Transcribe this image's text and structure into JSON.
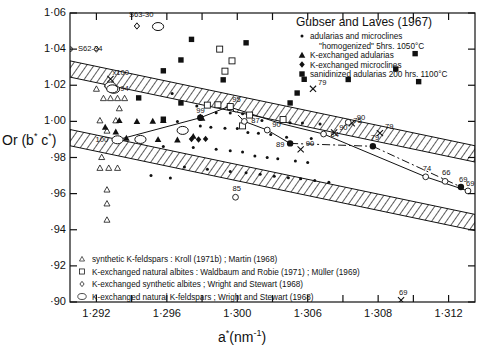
{
  "figure": {
    "xlabel_main": "a",
    "xlabel_sup": "*",
    "xlabel_unit": "(nm",
    "xlabel_unit_sup": "-1",
    "xlabel_unit_end": ")",
    "ylabel": "Or (b* c*)"
  },
  "chart_data": {
    "type": "scatter",
    "title": "",
    "xlabel": "a* (nm^-1)",
    "ylabel": "Or (b* c*)",
    "xlim": [
      1.2905,
      1.3135
    ],
    "ylim": [
      0.9,
      1.06
    ],
    "grid": false,
    "xticks": [
      "1·292",
      "1·296",
      "1·300",
      "1·306",
      "1·308",
      "1·312"
    ],
    "xtick_values": [
      1.292,
      1.296,
      1.3,
      1.304,
      1.308,
      1.312
    ],
    "yticks": [
      "1·06",
      "1·04",
      "1·02",
      "1·00",
      "·98",
      "·96",
      "·94",
      "·92",
      "·90"
    ],
    "ytick_values": [
      1.06,
      1.04,
      1.02,
      1.0,
      0.98,
      0.96,
      0.94,
      0.92,
      0.9
    ],
    "legend_position": "top-right and bottom-left inside axes",
    "bands": [
      {
        "name": "upper-hatched-band",
        "x1": 1.2905,
        "y1_top": 1.0335,
        "y1_bot": 1.0245,
        "x2": 1.3135,
        "y2_top": 0.9865,
        "y2_bot": 0.9775
      },
      {
        "name": "lower-hatched-band",
        "x1": 1.2905,
        "y1_top": 0.9955,
        "y1_bot": 0.9865,
        "x2": 1.3135,
        "y2_top": 0.9485,
        "y2_bot": 0.9395
      }
    ],
    "series": [
      {
        "name": "adularias and microclines \"homogenized\" 5hrs. 1050°C",
        "marker": "small-filled-circle",
        "points": [
          [
            1.2963,
            1.0155
          ],
          [
            1.2977,
            1.0085
          ],
          [
            1.2988,
            1.0048
          ],
          [
            1.2996,
            1.0046
          ],
          [
            1.3003,
            1.0042
          ],
          [
            1.3014,
            1.0005
          ],
          [
            1.3025,
            0.9998
          ],
          [
            1.303,
            0.9993
          ],
          [
            1.3037,
            0.9991
          ],
          [
            1.3047,
            0.9986
          ],
          [
            1.2966,
            0.9999
          ],
          [
            1.2979,
            0.9975
          ],
          [
            1.2985,
            0.9968
          ],
          [
            1.2993,
            0.9962
          ],
          [
            1.3,
            0.996
          ],
          [
            1.3006,
            0.9938
          ],
          [
            1.3012,
            0.9934
          ],
          [
            1.3019,
            0.9927
          ],
          [
            1.3028,
            0.9912
          ],
          [
            1.3042,
            0.9905
          ],
          [
            1.2958,
            0.9861
          ],
          [
            1.2975,
            0.9855
          ],
          [
            1.2988,
            0.9846
          ],
          [
            1.2996,
            0.9837
          ],
          [
            1.3003,
            0.983
          ],
          [
            1.301,
            0.9808
          ],
          [
            1.3017,
            0.98
          ],
          [
            1.3023,
            0.9793
          ],
          [
            1.3033,
            0.978
          ],
          [
            1.304,
            0.9772
          ],
          [
            1.297,
            0.9747
          ],
          [
            1.2983,
            0.9735
          ],
          [
            1.2996,
            0.9722
          ],
          [
            1.3005,
            0.9715
          ],
          [
            1.3013,
            0.9707
          ],
          [
            1.3021,
            0.9696
          ],
          [
            1.3029,
            0.9688
          ],
          [
            1.3036,
            0.9682
          ],
          [
            1.3044,
            0.9673
          ],
          [
            1.3052,
            0.9663
          ],
          [
            1.2951,
            0.97
          ],
          [
            1.2962,
            0.9686
          ]
        ]
      },
      {
        "name": "K-exchanged adularias",
        "marker": "filled-triangle",
        "points": [
          [
            1.2933,
            1.0005
          ],
          [
            1.2943,
            1.0
          ],
          [
            1.2952,
            1.0002
          ],
          [
            1.2958,
            1.0006
          ],
          [
            1.2925,
            0.9968
          ],
          [
            1.2931,
            0.9942
          ],
          [
            1.2937,
            0.9908
          ],
          [
            1.2944,
            0.9903
          ],
          [
            1.2955,
            0.99
          ],
          [
            1.2966,
            0.9898
          ],
          [
            1.2975,
            0.9918
          ],
          [
            1.298,
            1.0018
          ]
        ]
      },
      {
        "name": "K-exchanged microclines",
        "marker": "filled-diamond-cluster",
        "points": [
          [
            1.2974,
            0.9902
          ],
          [
            1.2978,
            0.99
          ],
          [
            1.2982,
            0.9903
          ],
          [
            1.2979,
            1.0024
          ]
        ]
      },
      {
        "name": "sanidinized adularias 200 hrs. 1100°C",
        "marker": "filled-square",
        "points": [
          [
            1.2958,
            1.028
          ],
          [
            1.2974,
            1.0454
          ],
          [
            1.2968,
            1.034
          ],
          [
            1.3005,
            1.0435
          ],
          [
            1.3038,
            1.0233
          ],
          [
            1.3063,
            1.0232
          ],
          [
            1.2992,
            1.023
          ],
          [
            1.2944,
            1.013
          ],
          [
            1.2968,
            1.0102
          ],
          [
            1.2958,
            1.0012
          ],
          [
            1.309,
            1.029
          ],
          [
            1.3103,
            1.022
          ],
          [
            1.3101,
            1.0375
          ],
          [
            1.3034,
            1.0157
          ],
          [
            1.303,
            1.0102
          ]
        ]
      },
      {
        "name": "synthetic K-feldspars: Kroll (1971b); Martin (1968)",
        "marker": "open-triangle-small",
        "points": [
          [
            1.292,
            1.018
          ],
          [
            1.2928,
            1.018
          ],
          [
            1.2924,
            1.0128
          ],
          [
            1.2928,
            1.0128
          ],
          [
            1.2932,
            1.0128
          ],
          [
            1.2936,
            1.0128
          ],
          [
            1.2933,
            1.0072
          ],
          [
            1.2922,
            1.0005
          ],
          [
            1.2931,
            1.0005
          ],
          [
            1.2926,
            0.9948
          ],
          [
            1.2923,
            0.9802
          ],
          [
            1.2922,
            0.9742
          ],
          [
            1.2927,
            0.9742
          ],
          [
            1.2932,
            0.9742
          ],
          [
            1.2926,
            0.9622
          ],
          [
            1.2926,
            0.9545
          ],
          [
            1.2926,
            0.9455
          ]
        ]
      },
      {
        "name": "K-exchanged natural albites: Waldbaum and Robie (1971); Müller (1969)",
        "marker": "open-square",
        "points": [
          [
            1.299,
            1.04
          ],
          [
            1.2997,
            1.0335
          ],
          [
            1.2993,
            1.0278
          ],
          [
            1.2983,
            1.009
          ],
          [
            1.2989,
            1.0092
          ],
          [
            1.3007,
            1.0035
          ],
          [
            1.3003,
            0.9975
          ],
          [
            1.3026,
            1.001
          ]
        ]
      },
      {
        "name": "K-exchanged synthetic albites: Wright and Stewart (1968)",
        "marker": "open-diamond-small",
        "points": [
          [
            1.2943,
            1.0528
          ],
          [
            1.292,
            1.04
          ],
          [
            1.2926,
            1.0195
          ],
          [
            1.2931,
            1.018
          ]
        ]
      },
      {
        "name": "K-exchanged natural K-feldspars: Wright and Stewart (1968)",
        "marker": "open-circle-large",
        "points": [
          [
            1.2955,
            1.0525
          ],
          [
            1.2928,
            1.0196
          ],
          [
            1.293,
            1.0178
          ],
          [
            1.2969,
            0.995
          ],
          [
            1.2945,
            0.99
          ]
        ]
      }
    ],
    "curves": [
      {
        "name": "curve-100-99-95",
        "style": "solid",
        "points": [
          [
            1.2932,
            0.9898
          ],
          [
            1.2979,
            1.002
          ],
          [
            1.2995,
            1.0082
          ]
        ]
      },
      {
        "name": "curve-95-90-84",
        "style": "solid",
        "points": [
          [
            1.2995,
            1.0082
          ],
          [
            1.3024,
            0.999
          ],
          [
            1.3049,
            0.993
          ]
        ]
      },
      {
        "name": "curve-84-74",
        "style": "solid",
        "points": [
          [
            1.3049,
            0.993
          ],
          [
            1.3107,
            0.9693
          ]
        ]
      },
      {
        "name": "curve-74-69open",
        "style": "solid",
        "points": [
          [
            1.3107,
            0.9693
          ],
          [
            1.3131,
            0.9615
          ]
        ]
      },
      {
        "name": "curve-87-90-89-dashed",
        "style": "solid",
        "points": [
          [
            1.3004,
            1.0
          ],
          [
            1.3017,
            0.9952
          ],
          [
            1.303,
            0.9878
          ]
        ]
      },
      {
        "name": "curve-95-87-longdash",
        "style": "dashed",
        "points": [
          [
            1.2996,
            1.0078
          ],
          [
            1.3004,
            1.0
          ]
        ]
      },
      {
        "name": "curve-89-79-dashdot",
        "style": "dashdot",
        "points": [
          [
            1.303,
            0.9878
          ],
          [
            1.3077,
            0.9862
          ]
        ]
      },
      {
        "name": "curve-79-69filled-dashdot",
        "style": "dashdot",
        "points": [
          [
            1.3077,
            0.9862
          ],
          [
            1.3127,
            0.9637
          ]
        ]
      }
    ],
    "labeled_points": [
      {
        "label": "S63-30",
        "x": 1.2943,
        "y": 1.0528,
        "marker": "open-diamond-small"
      },
      {
        "label": "S62-34",
        "x": 1.2905,
        "y": 1.04,
        "marker": "open-circle-tiny"
      },
      {
        "label": "x100",
        "x": 1.2928,
        "y": 1.0235,
        "marker": "cross"
      },
      {
        "label": "94",
        "x": 1.2929,
        "y": 1.018,
        "marker": "open-circle-large"
      },
      {
        "label": "95",
        "x": 1.2996,
        "y": 1.0082,
        "marker": "open-square"
      },
      {
        "label": "99",
        "x": 1.2979,
        "y": 1.002,
        "marker": "filled-circle-large"
      },
      {
        "label": "100",
        "x": 1.2932,
        "y": 0.9898,
        "marker": "open-circle-large"
      },
      {
        "label": "87",
        "x": 1.3004,
        "y": 1.0,
        "marker": "open-circle"
      },
      {
        "label": "90",
        "x": 1.3017,
        "y": 0.9952,
        "marker": "open-circle"
      },
      {
        "label": "90",
        "x": 1.3055,
        "y": 0.9938,
        "marker": "cross"
      },
      {
        "label": "90",
        "x": 1.3065,
        "y": 0.999,
        "marker": "cross"
      },
      {
        "label": "90",
        "x": 1.3036,
        "y": 0.9845,
        "marker": "cross"
      },
      {
        "label": "84",
        "x": 1.3049,
        "y": 0.993,
        "marker": "open-circle"
      },
      {
        "label": "89",
        "x": 1.303,
        "y": 0.9878,
        "marker": "filled-circle-large"
      },
      {
        "label": "79",
        "x": 1.3043,
        "y": 1.018,
        "marker": "cross"
      },
      {
        "label": "79",
        "x": 1.3077,
        "y": 0.9862,
        "marker": "filled-circle-large"
      },
      {
        "label": "79",
        "x": 1.3081,
        "y": 0.9935,
        "marker": "cross"
      },
      {
        "label": "75",
        "x": 1.3063,
        "y": 0.9995,
        "marker": "open-circle"
      },
      {
        "label": "85",
        "x": 1.2999,
        "y": 0.958,
        "marker": "open-circle"
      },
      {
        "label": "66",
        "x": 1.3118,
        "y": 0.9668,
        "marker": "open-circle"
      },
      {
        "label": "74",
        "x": 1.3107,
        "y": 0.9693,
        "marker": "open-circle"
      },
      {
        "label": "69",
        "x": 1.3127,
        "y": 0.9637,
        "marker": "filled-circle-large"
      },
      {
        "label": "69",
        "x": 1.3131,
        "y": 0.9615,
        "marker": "open-circle"
      },
      {
        "label": "69",
        "x": 1.3093,
        "y": 0.901,
        "marker": "cross"
      }
    ]
  },
  "legend_top": {
    "title": "Gubser and Laves (1967)",
    "entries": [
      {
        "marker": "small-filled-circle",
        "line1": "adularias and microclines",
        "line2": "\"homogenized\"  5hrs. 1050°C"
      },
      {
        "marker": "filled-triangle",
        "line1": "K-exchanged  adularias",
        "line2": ""
      },
      {
        "marker": "filled-diamond",
        "line1": "K-exchanged  microclines",
        "line2": ""
      },
      {
        "marker": "filled-square",
        "line1": "sanidinized adularias 200 hrs. 1100°C",
        "line2": ""
      }
    ]
  },
  "legend_bottom": {
    "entries": [
      {
        "marker": "open-triangle-small",
        "text": "synthetic  K-feldspars : Kroll (1971b) ; Martin (1968)"
      },
      {
        "marker": "open-square",
        "text": "K-exchanged natural albites : Waldbaum and Robie (1971) ; Müller (1969)"
      },
      {
        "marker": "open-diamond-small",
        "text": "K-exchanged synthetic albites ; Wright and Stewart (1968)"
      },
      {
        "marker": "open-circle-large",
        "text": "K-exchanged  natural K-feldspars ; Wright and Stewart (1968)"
      }
    ]
  }
}
